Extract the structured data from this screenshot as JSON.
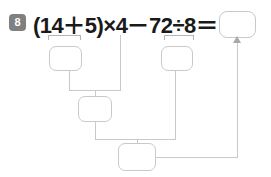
{
  "problem": {
    "number": "8",
    "expression": "(14＋5)×4－72÷8＝"
  },
  "boxes": {
    "answer": "",
    "sum": "",
    "quotient": "",
    "product": "",
    "difference": ""
  },
  "colors": {
    "badge_background": "#808080",
    "badge_text": "#ffffff",
    "expression_text": "#1a1a1a",
    "box_border": "#c9c9c9",
    "connector": "#c9c9c9",
    "bracket": "#b5b5b5",
    "page_background": "#ffffff"
  },
  "icons": {
    "arrow_up": "arrow-up-icon"
  }
}
